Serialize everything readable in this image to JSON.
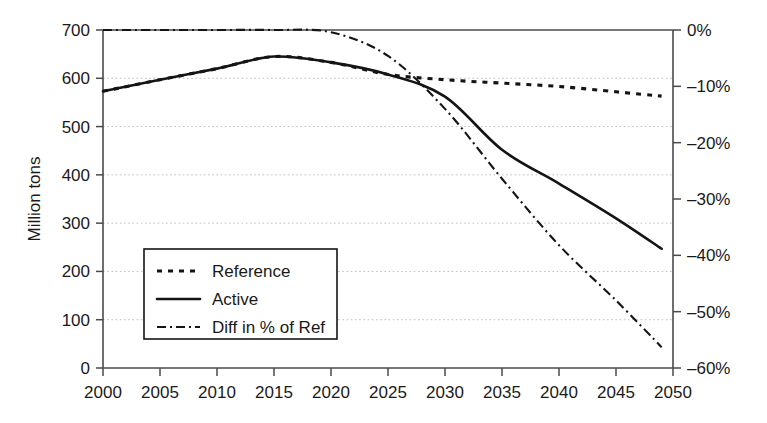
{
  "chart_data": {
    "type": "line",
    "title": "",
    "subtitle": "",
    "xlabel": "",
    "ylabel": "Million tons",
    "y2label": "",
    "xlim": [
      2000,
      2050
    ],
    "ylim": [
      0,
      700
    ],
    "y2lim": [
      -60,
      0
    ],
    "grid": true,
    "grid_axis": "y",
    "legend_position": "lower-left-inside",
    "x_ticks": [
      "2000",
      "2005",
      "2010",
      "2015",
      "2020",
      "2025",
      "2030",
      "2035",
      "2040",
      "2045",
      "2050"
    ],
    "x_tick_values": [
      2000,
      2005,
      2010,
      2015,
      2020,
      2025,
      2030,
      2035,
      2040,
      2045,
      2050
    ],
    "y_ticks": [
      "0",
      "100",
      "200",
      "300",
      "400",
      "500",
      "600",
      "700"
    ],
    "y_tick_values": [
      0,
      100,
      200,
      300,
      400,
      500,
      600,
      700
    ],
    "y2_ticks": [
      "0%",
      "–10%",
      "–20%",
      "–30%",
      "–40%",
      "–50%",
      "–60%"
    ],
    "y2_tick_values": [
      0,
      -10,
      -20,
      -30,
      -40,
      -50,
      -60
    ],
    "x": [
      2000,
      2005,
      2010,
      2015,
      2020,
      2025,
      2030,
      2035,
      2040,
      2045,
      2049
    ],
    "series": [
      {
        "name": "Reference",
        "axis": "left",
        "units": "Million tons",
        "style": "dotted",
        "color": "#141414",
        "values": [
          573,
          597,
          620,
          645,
          633,
          608,
          597,
          590,
          583,
          572,
          563
        ]
      },
      {
        "name": "Active",
        "axis": "left",
        "units": "Million tons",
        "style": "solid",
        "color": "#141414",
        "values": [
          573,
          597,
          620,
          645,
          633,
          608,
          562,
          452,
          382,
          310,
          247
        ]
      },
      {
        "name": "Diff in % of Ref",
        "axis": "right",
        "units": "%",
        "style": "dash-dot",
        "color": "#141414",
        "values": [
          0,
          0,
          0,
          0,
          -0.4,
          -4.6,
          -14.0,
          -26.4,
          -38.2,
          -48.0,
          -56.3
        ]
      }
    ]
  },
  "legend": {
    "entries": [
      {
        "label": "Reference",
        "style": "dotted"
      },
      {
        "label": "Active",
        "style": "solid"
      },
      {
        "label": "Diff in % of Ref",
        "style": "dash-dot"
      }
    ]
  },
  "colors": {
    "background": "#ffffff",
    "ink": "#141414",
    "axis": "#4a4a4a",
    "grid": "#b9b9b9"
  }
}
